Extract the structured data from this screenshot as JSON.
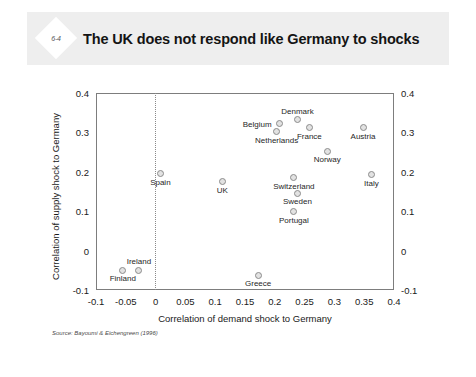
{
  "slide": {
    "badge": "6-4",
    "title": "The UK does not respond like Germany to shocks",
    "source_note": "Source: Bayoumi & Eichengreen (1996)"
  },
  "chart_data": {
    "type": "scatter",
    "title": "The UK does not respond like Germany to shocks",
    "xlabel": "Correlation of demand shock to Germany",
    "ylabel": "Correlation of supply shock to Germany",
    "xlim": [
      -0.1,
      0.4
    ],
    "ylim": [
      -0.1,
      0.4
    ],
    "xticks": [
      "-0.1",
      "-0.05",
      "0",
      "0.05",
      "0.1",
      "0.15",
      "0.2",
      "0.25",
      "0.3",
      "0.35",
      "0.4"
    ],
    "xtick_values": [
      -0.1,
      -0.05,
      0,
      0.05,
      0.1,
      0.15,
      0.2,
      0.25,
      0.3,
      0.35,
      0.4
    ],
    "yticks": [
      "-0.1",
      "0",
      "0.1",
      "0.2",
      "0.3",
      "0.4"
    ],
    "ytick_values": [
      -0.1,
      0,
      0.1,
      0.2,
      0.3,
      0.4
    ],
    "grid": false,
    "legend": null,
    "y_axis_duplicated_right": true,
    "reference_line_x": 0,
    "marker_color": "#8c8c8c",
    "marker_fill": "#e2e2e2",
    "frame_color": "#7d7d7d",
    "points": [
      {
        "label": "Finland",
        "x": -0.055,
        "y": -0.05,
        "label_pos": "below"
      },
      {
        "label": "Ireland",
        "x": -0.028,
        "y": -0.05,
        "label_pos": "above"
      },
      {
        "label": "Spain",
        "x": 0.008,
        "y": 0.195,
        "label_pos": "below"
      },
      {
        "label": "UK",
        "x": 0.112,
        "y": 0.175,
        "label_pos": "below"
      },
      {
        "label": "Greece",
        "x": 0.172,
        "y": -0.062,
        "label_pos": "below"
      },
      {
        "label": "Belgium",
        "x": 0.208,
        "y": 0.322,
        "label_pos": "left"
      },
      {
        "label": "Netherlands",
        "x": 0.203,
        "y": 0.302,
        "label_pos": "below"
      },
      {
        "label": "Denmark",
        "x": 0.238,
        "y": 0.332,
        "label_pos": "above"
      },
      {
        "label": "France",
        "x": 0.258,
        "y": 0.312,
        "label_pos": "below"
      },
      {
        "label": "Switzerland",
        "x": 0.232,
        "y": 0.185,
        "label_pos": "below"
      },
      {
        "label": "Sweden",
        "x": 0.238,
        "y": 0.145,
        "label_pos": "below"
      },
      {
        "label": "Portugal",
        "x": 0.232,
        "y": 0.098,
        "label_pos": "below"
      },
      {
        "label": "Norway",
        "x": 0.288,
        "y": 0.252,
        "label_pos": "below"
      },
      {
        "label": "Austria",
        "x": 0.348,
        "y": 0.312,
        "label_pos": "below"
      },
      {
        "label": "Italy",
        "x": 0.362,
        "y": 0.192,
        "label_pos": "below"
      }
    ]
  }
}
